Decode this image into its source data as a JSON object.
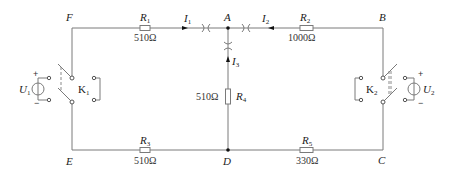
{
  "diagram": {
    "type": "circuit-schematic",
    "nodes": {
      "A": "A",
      "B": "B",
      "C": "C",
      "D": "D",
      "E": "E",
      "F": "F"
    },
    "resistors": [
      {
        "name": "R",
        "sub": "1",
        "value": "510Ω",
        "between": "F-A"
      },
      {
        "name": "R",
        "sub": "2",
        "value": "1000Ω",
        "between": "A-B"
      },
      {
        "name": "R",
        "sub": "3",
        "value": "510Ω",
        "between": "E-D"
      },
      {
        "name": "R",
        "sub": "4",
        "value": "510Ω",
        "between": "A-D"
      },
      {
        "name": "R",
        "sub": "5",
        "value": "330Ω",
        "between": "D-C"
      }
    ],
    "currents": [
      {
        "name": "I",
        "sub": "1",
        "direction": "F→A"
      },
      {
        "name": "I",
        "sub": "2",
        "direction": "B→A"
      },
      {
        "name": "I",
        "sub": "3",
        "direction": "D→A"
      }
    ],
    "sources": [
      {
        "name": "U",
        "sub": "1",
        "plus": "+",
        "minus": "−"
      },
      {
        "name": "U",
        "sub": "2",
        "plus": "+",
        "minus": "−"
      }
    ],
    "switches": [
      {
        "name": "K",
        "sub": "1"
      },
      {
        "name": "K",
        "sub": "2"
      }
    ],
    "colors": {
      "wire": "#7a7a7a",
      "text": "#222222",
      "junction": "#111111"
    }
  }
}
